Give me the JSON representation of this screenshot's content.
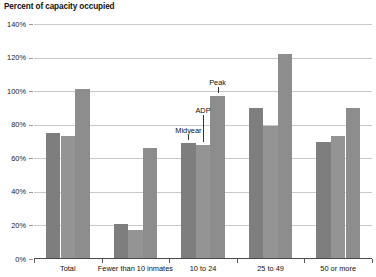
{
  "chart_data": {
    "type": "bar",
    "title": "Percent of capacity occupied",
    "xlabel": "",
    "ylabel": "",
    "ylim": [
      0,
      140
    ],
    "ytick_values": [
      0,
      20,
      40,
      60,
      80,
      100,
      120,
      140
    ],
    "ytick_labels": [
      "0%",
      "20%",
      "40%",
      "60%",
      "80%",
      "100%",
      "120%",
      "140%"
    ],
    "grid": true,
    "legend": "annotations-inline",
    "categories": [
      "Total",
      "Fewer than 10 inmates",
      "10 to 24",
      "25 to 49",
      "50 or more"
    ],
    "series": [
      {
        "name": "Midyear",
        "values": [
          75,
          21,
          69,
          90,
          70
        ],
        "color": "#7e7e7e"
      },
      {
        "name": "ADP",
        "values": [
          73,
          17,
          68,
          79,
          73
        ],
        "color": "#949494"
      },
      {
        "name": "Peak",
        "values": [
          101,
          66,
          97,
          122,
          90
        ],
        "color": "#8d8d8d"
      }
    ],
    "annotations": [
      {
        "text": "Midyear",
        "target_category": "10 to 24",
        "target_series": "Midyear"
      },
      {
        "text": "ADP",
        "target_category": "10 to 24",
        "target_series": "ADP"
      },
      {
        "text": "Peak",
        "target_category": "10 to 24",
        "target_series": "Peak"
      }
    ]
  }
}
